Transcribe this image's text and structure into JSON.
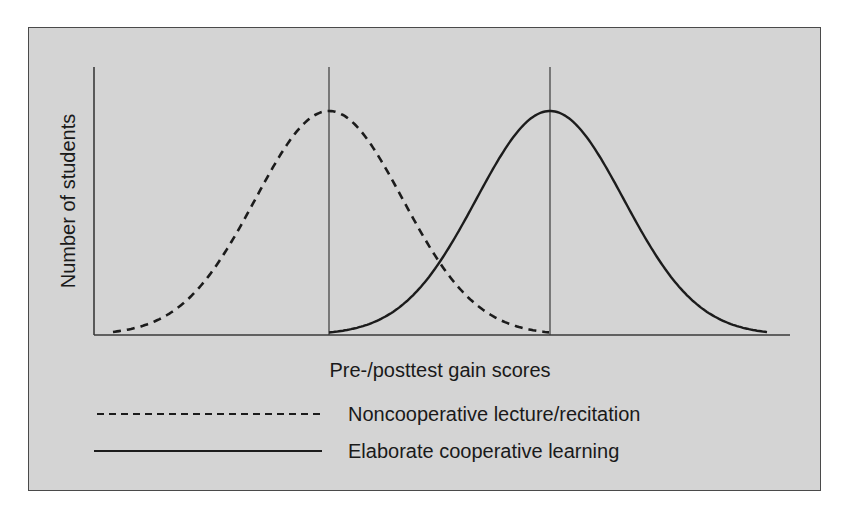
{
  "chart_data": {
    "type": "line",
    "title": "",
    "xlabel": "Pre-/posttest gain scores",
    "ylabel": "Number of students",
    "grid": false,
    "legend_position": "below",
    "x_ticks": [],
    "y_ticks": [],
    "series": [
      {
        "name": "Noncooperative lecture/recitation",
        "style": "dashed",
        "shape": "normal distribution",
        "mean_px": 329,
        "start_px": 113,
        "end_px": 550,
        "peak_y_px": 111,
        "relative_peak": 1.0
      },
      {
        "name": "Elaborate cooperative learning",
        "style": "solid",
        "shape": "normal distribution",
        "mean_px": 550,
        "start_px": 329,
        "end_px": 768,
        "peak_y_px": 111,
        "relative_peak": 1.0
      }
    ],
    "annotations": [
      "Vertical reference line at mean of noncooperative distribution",
      "Vertical reference line at mean of cooperative distribution"
    ]
  },
  "axes": {
    "origin_x": 94,
    "baseline_y": 335,
    "y_top": 67,
    "x_end": 790
  },
  "mean_lines": [
    {
      "x": 329,
      "top": 67
    },
    {
      "x": 550,
      "top": 67
    }
  ],
  "labels": {
    "xlabel": "Pre-/posttest gain scores",
    "ylabel": "Number of students"
  },
  "legend": {
    "items": [
      {
        "label": "Noncooperative lecture/recitation",
        "style": "dashed"
      },
      {
        "label": "Elaborate cooperative learning",
        "style": "solid"
      }
    ]
  },
  "colors": {
    "background": "#d4d4d4",
    "ink": "#1c1c1c",
    "frame": "#4a4a4a"
  }
}
